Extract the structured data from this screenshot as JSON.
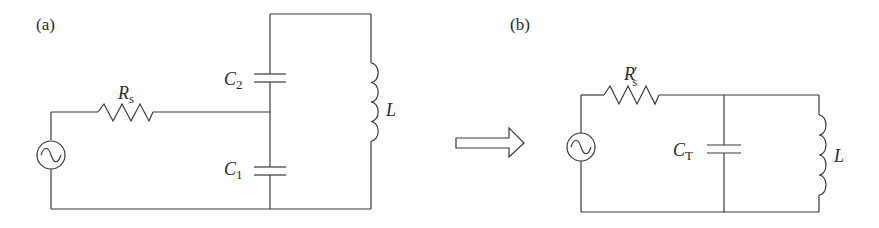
{
  "figure": {
    "panels": [
      {
        "id": "a",
        "label": "(a)",
        "components": {
          "source": {
            "type": "ac-voltage-source",
            "symbol": "~"
          },
          "resistor": {
            "name": "R",
            "subscript": "s",
            "prime": ""
          },
          "capacitor_top": {
            "name": "C",
            "subscript": "2"
          },
          "capacitor_bottom": {
            "name": "C",
            "subscript": "1"
          },
          "inductor": {
            "name": "L"
          }
        }
      },
      {
        "id": "b",
        "label": "(b)",
        "components": {
          "source": {
            "type": "ac-voltage-source",
            "symbol": "~"
          },
          "resistor": {
            "name": "R",
            "subscript": "s",
            "prime": "′"
          },
          "capacitor": {
            "name": "C",
            "subscript": "T"
          },
          "inductor": {
            "name": "L"
          }
        }
      }
    ],
    "transform_arrow": {
      "direction": "right",
      "meaning": "equivalent-circuit"
    },
    "colors": {
      "line": "#3a3a3a",
      "text": "#2a2a2a",
      "background": "#ffffff"
    }
  }
}
